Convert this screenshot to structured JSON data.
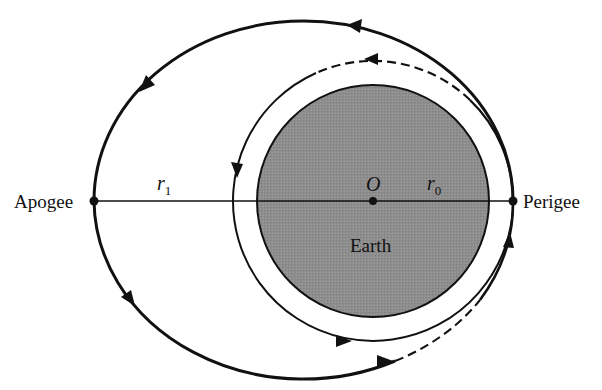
{
  "diagram": {
    "labels": {
      "apogee": "Apogee",
      "perigee": "Perigee",
      "earth": "Earth",
      "center": "O",
      "r1_main": "r",
      "r1_sub": "1",
      "r0_main": "r",
      "r0_sub": "0"
    },
    "colors": {
      "earth_fill": "#8c8c8c",
      "stroke": "#111111",
      "background": "#ffffff"
    },
    "geometry": {
      "earth": {
        "cx": 373,
        "cy": 201,
        "r": 116
      },
      "circular_orbit": {
        "cx": 373,
        "cy": 201,
        "r": 140
      },
      "elliptical_orbit": {
        "cx": 303.5,
        "cy": 201,
        "rx": 209.5,
        "ry": 180
      },
      "apogee_point": [
        94,
        201
      ],
      "perigee_point": [
        513,
        201
      ],
      "center_point": [
        373,
        201
      ]
    }
  }
}
